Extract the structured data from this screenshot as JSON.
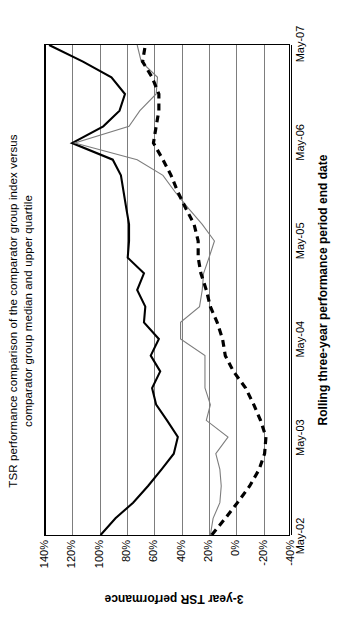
{
  "chart_data": {
    "type": "line",
    "title": "TSR performance comparison of the comparator group index versus comparator group median and upper quartile",
    "title_lines": [
      "TSR performance comparison of the comparator group index versus",
      "comparator group median and upper quartile"
    ],
    "xlabel": "Rolling three-year performance period end date",
    "ylabel": "3-year TSR performance",
    "x_tick_labels": [
      "May-02",
      "May-03",
      "May-04",
      "May-05",
      "May-06",
      "May-07"
    ],
    "x_tick_positions": [
      0,
      1,
      2,
      3,
      4,
      5
    ],
    "y_tick_labels": [
      "140%",
      "120%",
      "100%",
      "80%",
      "60%",
      "40%",
      "20%",
      "0%",
      "-20%",
      "-40%"
    ],
    "y_tick_values": [
      140,
      120,
      100,
      80,
      60,
      40,
      20,
      0,
      -20,
      -40
    ],
    "ylim": [
      -40,
      140
    ],
    "xlim": [
      0,
      5
    ],
    "grid": "horizontal",
    "legend": "none",
    "y_unit": "%",
    "series": [
      {
        "name": "Comparator group upper quartile",
        "style": "solid",
        "color": "#000000",
        "width": 2.1,
        "x": [
          0.0,
          0.17,
          0.33,
          0.5,
          0.67,
          0.83,
          1.0,
          1.17,
          1.33,
          1.5,
          1.67,
          1.83,
          2.0,
          2.17,
          2.33,
          2.5,
          2.67,
          2.83,
          3.0,
          3.17,
          3.33,
          3.5,
          3.67,
          3.83,
          4.0,
          4.17,
          4.33,
          4.5,
          4.67,
          4.83,
          5.0
        ],
        "values": [
          99,
          88,
          75,
          64,
          54,
          45,
          42,
          50,
          58,
          61,
          55,
          62,
          56,
          67,
          66,
          72,
          67,
          79,
          78,
          78,
          80,
          82,
          84,
          90,
          120,
          97,
          85,
          81,
          91,
          112,
          137
        ]
      },
      {
        "name": "Comparator group median",
        "style": "solid",
        "color": "#7d7d7d",
        "width": 1.1,
        "x": [
          0.0,
          0.17,
          0.33,
          0.5,
          0.67,
          0.83,
          1.0,
          1.17,
          1.33,
          1.5,
          1.67,
          1.83,
          2.0,
          2.17,
          2.33,
          2.5,
          2.67,
          2.83,
          3.0,
          3.17,
          3.33,
          3.5,
          3.67,
          3.83,
          4.0,
          4.17,
          4.33,
          4.5,
          4.67,
          4.83,
          5.0
        ],
        "values": [
          18,
          16,
          11,
          10,
          11,
          14,
          5,
          21,
          18,
          22,
          22,
          22,
          40,
          40,
          26,
          24,
          23,
          19,
          15,
          24,
          34,
          44,
          53,
          72,
          118,
          78,
          70,
          58,
          57,
          69,
          72
        ]
      },
      {
        "name": "Comparator group index",
        "style": "dashed",
        "color": "#000000",
        "width": 3.2,
        "x": [
          0.0,
          0.17,
          0.33,
          0.5,
          0.67,
          0.83,
          1.0,
          1.17,
          1.33,
          1.5,
          1.67,
          1.83,
          2.0,
          2.17,
          2.33,
          2.5,
          2.67,
          2.83,
          3.0,
          3.17,
          3.33,
          3.5,
          3.67,
          3.83,
          4.0,
          4.17,
          4.33,
          4.5,
          4.67,
          4.83,
          5.0
        ],
        "values": [
          17,
          7,
          -2,
          -11,
          -18,
          -22,
          -23,
          -19,
          -14,
          -8,
          1,
          7,
          9,
          13,
          18,
          21,
          25,
          27,
          27,
          30,
          36,
          42,
          47,
          53,
          60,
          58,
          56,
          56,
          61,
          68,
          66
        ]
      }
    ]
  }
}
